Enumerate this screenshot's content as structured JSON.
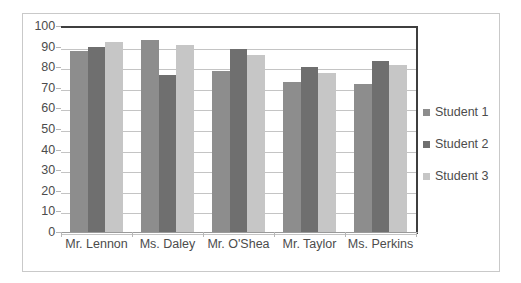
{
  "chart_data": {
    "type": "bar",
    "title": "",
    "subtitle": "",
    "xlabel": "",
    "ylabel": "",
    "ylim": [
      0,
      100
    ],
    "ytick_step": 10,
    "yticks": [
      100,
      90,
      80,
      70,
      60,
      50,
      40,
      30,
      20,
      10,
      0
    ],
    "grid": true,
    "grid_axis": "y",
    "legend_position": "right",
    "categories": [
      "Mr. Lennon",
      "Ms. Daley",
      "Mr. O'Shea",
      "Mr. Taylor",
      "Ms. Perkins"
    ],
    "series": [
      {
        "name": "Student 1",
        "color": "#8d8d8d",
        "values": [
          88,
          93,
          78,
          73,
          72
        ]
      },
      {
        "name": "Student 2",
        "color": "#6f6f6f",
        "values": [
          90,
          76,
          89,
          80,
          83
        ]
      },
      {
        "name": "Student 3",
        "color": "#c6c6c6",
        "values": [
          92,
          91,
          86,
          77,
          81
        ]
      }
    ]
  },
  "legend": {
    "items": [
      {
        "label": "Student 1",
        "swatch": "s1"
      },
      {
        "label": "Student 2",
        "swatch": "s2"
      },
      {
        "label": "Student 3",
        "swatch": "s3"
      }
    ]
  },
  "colors": {
    "series_1": "#8d8d8d",
    "series_2": "#6f6f6f",
    "series_3": "#c6c6c6",
    "gridline": "#c4c4c4",
    "axis": "#3f3f3f",
    "text": "#4c4c4c",
    "frame_border": "#c9c9c9",
    "background": "#ffffff"
  }
}
